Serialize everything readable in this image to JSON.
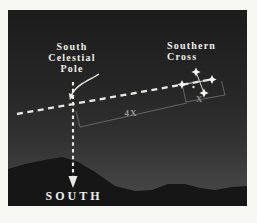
{
  "figure": {
    "labels": {
      "pole": "South\nCelestial\nPole",
      "constellation": "Southern\nCross",
      "direction": "SOUTH",
      "distance_long": "4X",
      "distance_short": "X"
    },
    "colors": {
      "frame_background": "#f7f7f4",
      "sky_top": "#1c1c1c",
      "sky_horizon": "#4a4a4a",
      "mountains": "#161616",
      "label_text": "#efefeb",
      "dashed_line": "#e8e8e4",
      "stars": "#f4f4f2",
      "measurement_lines": "#787878",
      "measurement_text": "#999999"
    },
    "star_count": 5
  }
}
